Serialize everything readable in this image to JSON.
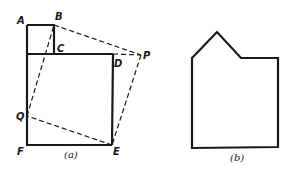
{
  "figure_a": {
    "caption": "(a)",
    "labels": {
      "A": "A",
      "B": "B",
      "C": "C",
      "D": "D",
      "E": "E",
      "F": "F",
      "P": "P",
      "Q": "Q"
    },
    "solid_shapes": [
      "small square A-B-C",
      "large square C-D-E-F"
    ],
    "dashed_lines": [
      "B-P",
      "P-E",
      "E-Q",
      "Q-B",
      "C-D-P extension"
    ]
  },
  "figure_b": {
    "caption": "(b)",
    "shape": "pentagon-like house shape with notch"
  },
  "colors": {
    "line": "#1a1a1a",
    "background": "#ffffff"
  }
}
